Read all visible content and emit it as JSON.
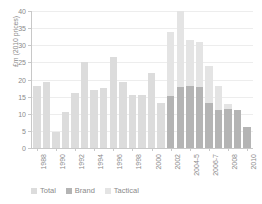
{
  "chart_data": {
    "type": "bar",
    "title": "",
    "subtitle": "",
    "xlabel": "",
    "ylabel": "£m (2010 prices)",
    "ylim": [
      0,
      40
    ],
    "ytick_values": [
      0,
      5,
      10,
      15,
      20,
      25,
      30,
      35,
      40
    ],
    "ytick_labels": [
      "0",
      "5",
      "10",
      "15",
      "20",
      "25",
      "30",
      "35",
      "40"
    ],
    "grid": true,
    "stacked": true,
    "legend_position": "bottom-left",
    "legend": [
      "Total",
      "Brand",
      "Tactical"
    ],
    "colors": {
      "total": "#dcdcdc",
      "brand": "#b4b4b4",
      "tactical": "#e4e4e4",
      "grid": "#ededed",
      "axis": "#c8c8c8",
      "text": "#8a8a8a"
    },
    "categories": [
      "1988",
      "1989",
      "1990",
      "1991",
      "1992",
      "1993",
      "1994",
      "1995",
      "1996",
      "1997",
      "1998",
      "1999",
      "2000",
      "2001",
      "2002",
      "2003",
      "2004-5",
      "2005-6",
      "2006-7",
      "2007-8",
      "2008",
      "2009",
      "2010"
    ],
    "xtick_labels": [
      "1988",
      "",
      "1990",
      "",
      "1992",
      "",
      "1994",
      "",
      "1996",
      "",
      "1998",
      "",
      "2000",
      "",
      "2002",
      "",
      "2004-5",
      "",
      "2006-7",
      "",
      "2008",
      "",
      "2010"
    ],
    "series": [
      {
        "name": "Total",
        "values": [
          18.0,
          19.2,
          4.7,
          10.5,
          16.0,
          25.2,
          17.0,
          17.4,
          26.6,
          19.2,
          15.5,
          15.5,
          22.0,
          13.2,
          null,
          null,
          null,
          null,
          null,
          null,
          null,
          null,
          null
        ]
      },
      {
        "name": "Brand",
        "values": [
          null,
          null,
          null,
          null,
          null,
          null,
          null,
          null,
          null,
          null,
          null,
          null,
          null,
          null,
          15.2,
          17.8,
          18.2,
          17.8,
          13.0,
          11.2,
          11.5,
          11.2,
          6.2
        ]
      },
      {
        "name": "Tactical",
        "values": [
          null,
          null,
          null,
          null,
          null,
          null,
          null,
          null,
          null,
          null,
          null,
          null,
          null,
          null,
          18.8,
          22.2,
          13.3,
          13.2,
          11.0,
          6.8,
          1.5,
          0.0,
          0.0
        ]
      }
    ],
    "totals": [
      18.0,
      19.2,
      4.7,
      10.5,
      16.0,
      25.2,
      17.0,
      17.4,
      26.6,
      19.2,
      15.5,
      15.5,
      22.0,
      13.2,
      34.0,
      40.0,
      31.5,
      31.0,
      24.0,
      18.0,
      13.0,
      11.2,
      6.2
    ]
  },
  "legend": {
    "items": [
      {
        "label": "Total",
        "key": "total"
      },
      {
        "label": "Brand",
        "key": "brand"
      },
      {
        "label": "Tactical",
        "key": "tactical"
      }
    ]
  }
}
